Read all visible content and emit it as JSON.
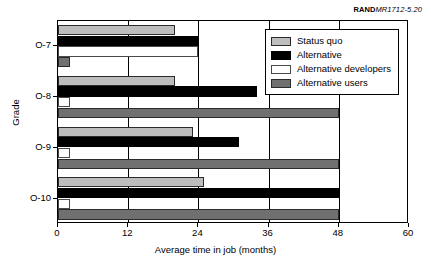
{
  "credit": {
    "brand": "RAND",
    "doc_id": "MR1712-5.20"
  },
  "chart_data": {
    "type": "bar",
    "orientation": "horizontal",
    "title": "",
    "xlabel": "Average time in job (months)",
    "ylabel": "Grade",
    "categories": [
      "O-7",
      "O-8",
      "O-9",
      "O-10"
    ],
    "xlim": [
      0,
      60
    ],
    "xticks": [
      0,
      12,
      24,
      36,
      48,
      60
    ],
    "xticklabels": [
      "0",
      "12",
      "24",
      "36",
      "48",
      "60"
    ],
    "grid": true,
    "legend_position": "upper right",
    "series": [
      {
        "name": "Status quo",
        "color": "#bdbdbd",
        "values": [
          20,
          20,
          23,
          25
        ]
      },
      {
        "name": "Alternative",
        "color": "#000000",
        "values": [
          24,
          34,
          31,
          48
        ]
      },
      {
        "name": "Alternative developers",
        "color": "#ffffff",
        "values": [
          24,
          2,
          2,
          2
        ]
      },
      {
        "name": "Alternative users",
        "color": "#707070",
        "values": [
          2,
          48,
          48,
          48
        ]
      }
    ]
  }
}
